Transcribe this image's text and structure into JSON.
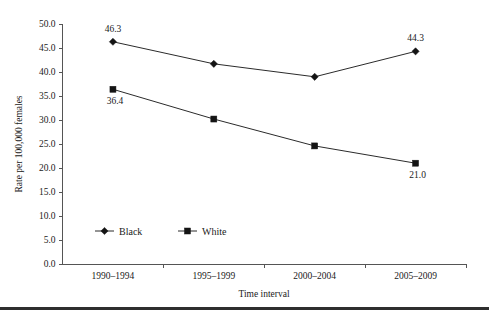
{
  "figure": {
    "bottom_rule_color": "#2e2e2e",
    "line_color": "#2b2b2b",
    "marker_color": "#141414",
    "axis_color": "#555555"
  },
  "chart_data": {
    "type": "line",
    "title": "",
    "xlabel": "Time interval",
    "ylabel": "Rate per 100,000 females",
    "categories": [
      "1990–1994",
      "1995–1999",
      "2000–2004",
      "2005–2009"
    ],
    "ylim": [
      0.0,
      50.0
    ],
    "yticks": [
      "0.0",
      "5.0",
      "10.0",
      "15.0",
      "20.0",
      "25.0",
      "30.0",
      "35.0",
      "40.0",
      "45.0",
      "50.0"
    ],
    "ytick_values": [
      0.0,
      5.0,
      10.0,
      15.0,
      20.0,
      25.0,
      30.0,
      35.0,
      40.0,
      45.0,
      50.0
    ],
    "grid": false,
    "legend_position": "inside lower-left",
    "series": [
      {
        "name": "Black",
        "marker": "diamond",
        "values": [
          46.3,
          41.7,
          39.0,
          44.3
        ],
        "point_labels": [
          "46.3",
          "",
          "",
          "44.3"
        ]
      },
      {
        "name": "White",
        "marker": "square",
        "values": [
          36.4,
          30.2,
          24.6,
          21.0
        ],
        "point_labels": [
          "36.4",
          "",
          "",
          "21.0"
        ]
      }
    ],
    "annotations": [
      {
        "text": "46.3",
        "series": "Black",
        "category": "1990–1994",
        "value": 46.3
      },
      {
        "text": "44.3",
        "series": "Black",
        "category": "2005–2009",
        "value": 44.3
      },
      {
        "text": "36.4",
        "series": "White",
        "category": "1990–1994",
        "value": 36.4
      },
      {
        "text": "21.0",
        "series": "White",
        "category": "2005–2009",
        "value": 21.0
      }
    ]
  }
}
